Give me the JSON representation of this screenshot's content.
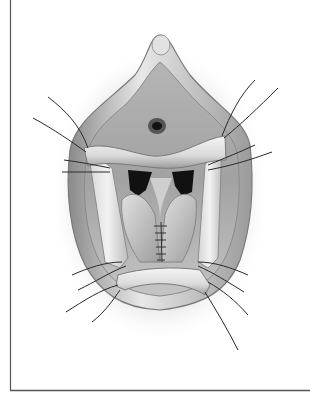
{
  "figure": {
    "kind": "surgical-illustration",
    "colors": {
      "background": "#ffffff",
      "border": "#555555",
      "tissue_light": "#eeeeee",
      "tissue_mid": "#bdbdbd",
      "tissue_dark": "#6e6e6e",
      "cavity": "#111111",
      "suture": "#2a2a2a"
    },
    "stay_sutures_count": 16,
    "closure_stitches_count": 6
  }
}
